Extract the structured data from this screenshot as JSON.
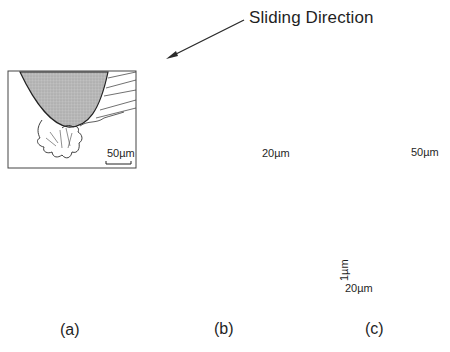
{
  "figure": {
    "annotation": {
      "text": "Sliding Direction",
      "arrow_direction": "down-left"
    },
    "panels": [
      {
        "id": "a",
        "label": "(a)",
        "micrograph_scale_bar": "50µm",
        "profile_shape": "deep narrow groove with slight raised shoulders"
      },
      {
        "id": "b",
        "label": "(b)",
        "micrograph_scale_bar": "20µm",
        "profile_shape": "groove with prominent raised ridges on both sides"
      },
      {
        "id": "c",
        "label": "(c)",
        "micrograph_scale_bar": "50µm",
        "profile_shape": "very shallow groove with small ridges",
        "profile_scale_vertical": "1µm",
        "profile_scale_horizontal": "20µm"
      }
    ],
    "colors": {
      "line": "#2a2a2a",
      "tip_fill": "#b8b8b8",
      "background": "#ffffff"
    }
  }
}
